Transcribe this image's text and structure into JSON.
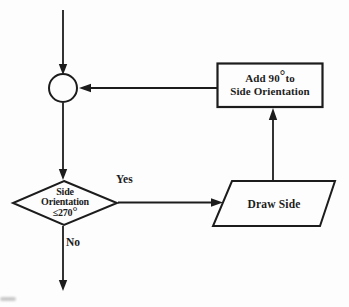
{
  "diagram": {
    "colors": {
      "ink": "#1c1c1c",
      "paper": "#fdfdfd"
    },
    "connector": {
      "shape": "circle"
    },
    "add_box": {
      "shape": "process-rectangle",
      "line1_prefix": "Add 90",
      "line1_degree": "°",
      "line1_suffix": "to",
      "line2": "Side Orientation"
    },
    "decision": {
      "shape": "diamond",
      "line1": "Side",
      "line2": "Orientation",
      "line3_prefix": "≤270",
      "line3_degree": "°"
    },
    "draw_side": {
      "shape": "parallelogram",
      "label": "Draw Side"
    },
    "edge_labels": {
      "yes": "Yes",
      "no": "No"
    }
  }
}
